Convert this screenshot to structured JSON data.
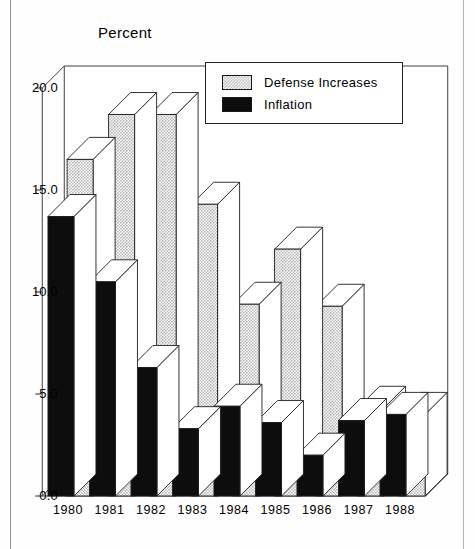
{
  "chart_data": {
    "type": "bar",
    "title": "Percent",
    "xlabel": "",
    "ylabel": "Percent",
    "categories": [
      "1980",
      "1981",
      "1982",
      "1983",
      "1984",
      "1985",
      "1986",
      "1987",
      "1988"
    ],
    "series": [
      {
        "name": "Defense Increases",
        "color": "#c9c9c9",
        "values": [
          16.5,
          18.7,
          18.7,
          14.3,
          9.4,
          12.1,
          9.3,
          4.3,
          4.0
        ]
      },
      {
        "name": "Inflation",
        "color": "#0d0d0d",
        "values": [
          13.7,
          10.5,
          6.3,
          3.3,
          4.4,
          3.6,
          2.0,
          3.7,
          4.0
        ]
      }
    ],
    "ylim": [
      0.0,
      20.0
    ],
    "yticks": [
      "0.0",
      "5.0",
      "10.0",
      "15.0",
      "20.0"
    ],
    "ytick_values": [
      0.0,
      5.0,
      10.0,
      15.0,
      20.0
    ],
    "grid": false,
    "legend_position": "top-right",
    "style": "3d-bars",
    "legend": [
      "Defense Increases",
      "Inflation"
    ]
  },
  "axis": {
    "y_labels": [
      "20.0",
      "15.0",
      "10.0",
      "5.0",
      "0.0"
    ],
    "x_labels": [
      "1980",
      "1981",
      "1982",
      "1983",
      "1984",
      "1985",
      "1986",
      "1987",
      "1988"
    ]
  },
  "legend": {
    "items": [
      {
        "label": "Defense Increases",
        "swatch": "defense-swatch"
      },
      {
        "label": "Inflation",
        "swatch": "inflation-swatch"
      }
    ]
  }
}
